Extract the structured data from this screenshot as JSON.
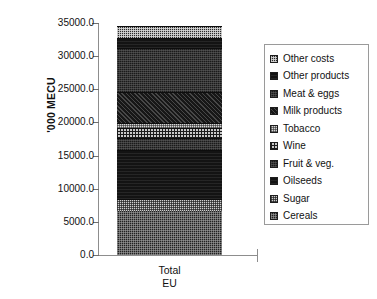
{
  "chart_data": {
    "type": "bar",
    "subtype": "stacked-bar",
    "title": "",
    "xlabel": "Total EU",
    "ylabel": "'000 MECU",
    "categories": [
      "Total EU"
    ],
    "category_lines": [
      "Total",
      "EU"
    ],
    "ylim": [
      0.0,
      35000.0
    ],
    "yticks": [
      0.0,
      5000.0,
      10000.0,
      15000.0,
      20000.0,
      25000.0,
      30000.0,
      35000.0
    ],
    "ytick_labels": [
      "0.0",
      "5000.0",
      "10000.0",
      "15000.0",
      "20000.0",
      "25000.0",
      "30000.0",
      "35000.0"
    ],
    "grid": false,
    "legend_position": "right",
    "total": 34500,
    "series": [
      {
        "name": "Cereals",
        "values": [
          6700
        ],
        "cum_start": 0,
        "cum_end": 6700,
        "pattern": "dark-checker"
      },
      {
        "name": "Sugar",
        "values": [
          1700
        ],
        "cum_start": 6700,
        "cum_end": 8400,
        "pattern": "light-checker"
      },
      {
        "name": "Oilseeds",
        "values": [
          7400
        ],
        "cum_start": 8400,
        "cum_end": 15800,
        "pattern": "solid-dark"
      },
      {
        "name": "Fruit & veg.",
        "values": [
          1900
        ],
        "cum_start": 15800,
        "cum_end": 17700,
        "pattern": "dense-dark"
      },
      {
        "name": "Wine",
        "values": [
          1400
        ],
        "cum_start": 17700,
        "cum_end": 19100,
        "pattern": "grid"
      },
      {
        "name": "Tobacco",
        "values": [
          800
        ],
        "cum_start": 19100,
        "cum_end": 19900,
        "pattern": "light-dot"
      },
      {
        "name": "Milk products",
        "values": [
          4700
        ],
        "cum_start": 19900,
        "cum_end": 24600,
        "pattern": "dark-dot"
      },
      {
        "name": "Meat & eggs",
        "values": [
          6600
        ],
        "cum_start": 24600,
        "cum_end": 31200,
        "pattern": "dense-dark"
      },
      {
        "name": "Other products",
        "values": [
          1600
        ],
        "cum_start": 31200,
        "cum_end": 32800,
        "pattern": "solid-dark"
      },
      {
        "name": "Other costs",
        "values": [
          1700
        ],
        "cum_start": 32800,
        "cum_end": 34500,
        "pattern": "checker-mid"
      }
    ],
    "legend_entries": [
      {
        "label": "Other costs",
        "pattern": "checker-mid"
      },
      {
        "label": "Other products",
        "pattern": "solid-dark"
      },
      {
        "label": "Meat & eggs",
        "pattern": "dense-dark"
      },
      {
        "label": "Milk products",
        "pattern": "dark-dot"
      },
      {
        "label": "Tobacco",
        "pattern": "light-dot"
      },
      {
        "label": "Wine",
        "pattern": "grid"
      },
      {
        "label": "Fruit & veg.",
        "pattern": "dense-dark"
      },
      {
        "label": "Oilseeds",
        "pattern": "solid-dark"
      },
      {
        "label": "Sugar",
        "pattern": "light-checker"
      },
      {
        "label": "Cereals",
        "pattern": "dark-checker"
      }
    ],
    "colors": {
      "axis": "#8d8d8d",
      "tick": "#6f6f6f",
      "text": "#111111",
      "legend_border": "#9a9a9a",
      "background": "#ffffff"
    }
  }
}
